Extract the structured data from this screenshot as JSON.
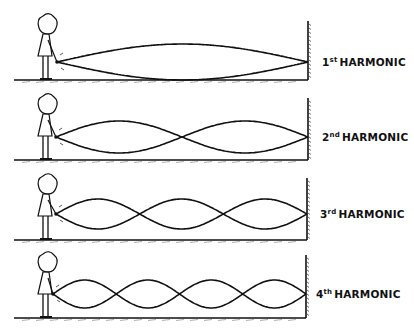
{
  "diagram": {
    "stroke_color": "#111111",
    "background": "#ffffff",
    "rows": [
      {
        "id": "h1",
        "num": "1",
        "suffix": "st",
        "word": "HARMONIC",
        "harmonic": 1,
        "baseline_y": 80,
        "axis_y": 62,
        "amplitude": 18,
        "x_start": 57,
        "x_end": 308,
        "wall_top": 21,
        "label_x": 322,
        "label_y": 56
      },
      {
        "id": "h2",
        "num": "2",
        "suffix": "nd",
        "word": "HARMONIC",
        "harmonic": 2,
        "baseline_y": 160,
        "axis_y": 137,
        "amplitude": 16,
        "x_start": 56,
        "x_end": 308,
        "wall_top": 98,
        "label_x": 322,
        "label_y": 131
      },
      {
        "id": "h3",
        "num": "3",
        "suffix": "rd",
        "word": "HARMONIC",
        "harmonic": 3,
        "baseline_y": 240,
        "axis_y": 214,
        "amplitude": 15,
        "x_start": 56,
        "x_end": 307,
        "wall_top": 178,
        "label_x": 320,
        "label_y": 208
      },
      {
        "id": "h4",
        "num": "4",
        "suffix": "th",
        "word": "HARMONIC",
        "harmonic": 4,
        "baseline_y": 318,
        "axis_y": 294,
        "amplitude": 14,
        "x_start": 53,
        "x_end": 306,
        "wall_top": 255,
        "label_x": 316,
        "label_y": 288
      }
    ]
  }
}
